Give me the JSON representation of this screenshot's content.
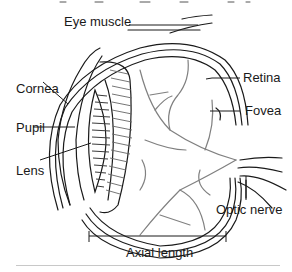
{
  "diagram": {
    "type": "anatomical cross-section",
    "labels": {
      "eye_muscle": "Eye muscle",
      "cornea": "Cornea",
      "pupil": "Pupil",
      "lens": "Lens",
      "retina": "Retina",
      "fovea": "Fovea",
      "optic_nerve": "Optic nerve",
      "axial_length": "Axial length"
    },
    "colors": {
      "outline": "#1a1a1a",
      "vessels": "#808080",
      "lens_dark": "#3a3a3a",
      "divider": "#c8c8c8"
    }
  }
}
